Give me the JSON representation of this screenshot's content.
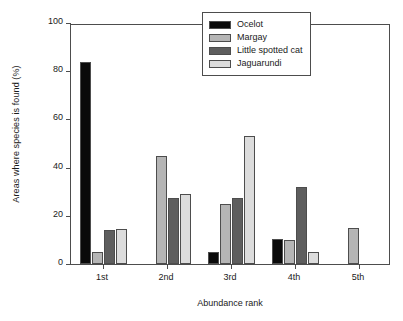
{
  "chart_data": {
    "type": "bar",
    "title": "",
    "xlabel": "Abundance rank",
    "ylabel": "Areas where species is found (%)",
    "categories": [
      "1st",
      "2nd",
      "3rd",
      "4th",
      "5th"
    ],
    "ylim": [
      0,
      100
    ],
    "yticks": [
      0,
      20,
      40,
      60,
      80,
      100
    ],
    "ytick_labels": [
      "0",
      "20",
      "40",
      "60",
      "80",
      "100"
    ],
    "grid": false,
    "legend_position": "top-right",
    "series": [
      {
        "name": "Ocelot",
        "color": "#0a0a0a",
        "values": [
          84,
          0,
          5,
          10.5,
          0
        ]
      },
      {
        "name": "Margay",
        "color": "#b5b5b5",
        "values": [
          5,
          45,
          25,
          10,
          15
        ]
      },
      {
        "name": "Little spotted cat",
        "color": "#5e5e5e",
        "values": [
          14,
          27.5,
          27.5,
          32,
          0
        ]
      },
      {
        "name": "Jaguarundi",
        "color": "#dcdcdc",
        "values": [
          14.5,
          29,
          53,
          5,
          0
        ]
      }
    ]
  },
  "legend": {
    "items": [
      {
        "label": "Ocelot",
        "color": "#0a0a0a"
      },
      {
        "label": "Margay",
        "color": "#b5b5b5"
      },
      {
        "label": "Little spotted cat",
        "color": "#5e5e5e"
      },
      {
        "label": "Jaguarundi",
        "color": "#dcdcdc"
      }
    ]
  },
  "colors": {
    "axis": "#4d4d4d",
    "text": "#1a1a1a",
    "background": "#ffffff"
  }
}
